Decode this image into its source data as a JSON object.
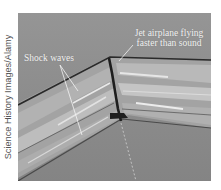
{
  "figure": {
    "credit": "Science History Images/Alamy",
    "labels": {
      "jet": [
        "Jet airplane flying",
        "faster than sound"
      ],
      "shock": "Shock waves"
    },
    "colors": {
      "background": "#8d8d8d",
      "label_text": "#f2f2f2",
      "shock_dark": "#2a2a2a",
      "shock_light": "#e6e6e6"
    }
  }
}
